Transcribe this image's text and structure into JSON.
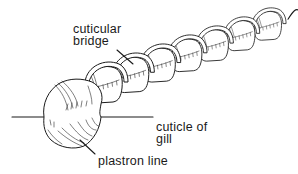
{
  "diagram": {
    "labels": {
      "cuticular_bridge": "cuticular\nbridge",
      "cuticle_of_gill": "cuticle of\ngill",
      "plastron_line": "plastron line"
    },
    "segment_count": 7,
    "colors": {
      "ink": "#1a1a1a",
      "background": "#ffffff"
    }
  }
}
